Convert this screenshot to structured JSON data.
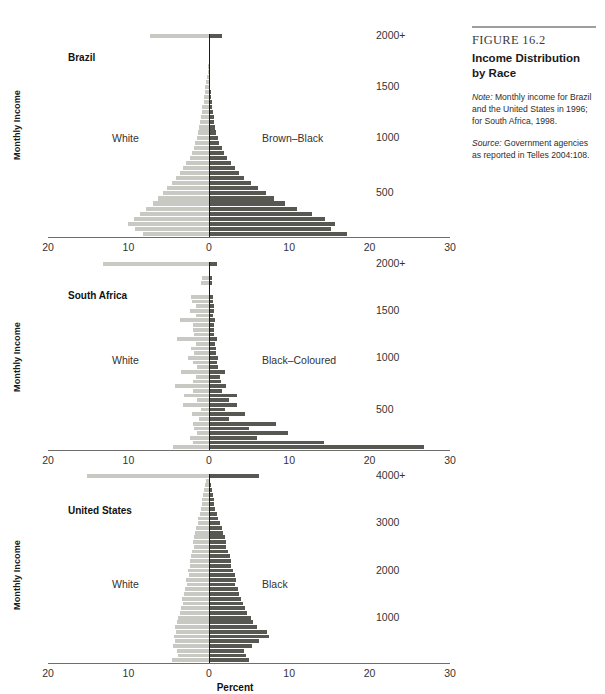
{
  "caption": {
    "figure_number": "FIGURE 16.2",
    "title": "Income Distribution by Race",
    "note_label": "Note:",
    "note_text": " Monthly income for Brazil and the United States in 1996; for South Africa, 1998.",
    "source_label": "Source:",
    "source_text": " Government agencies as reported in Telles 2004:108."
  },
  "axis": {
    "y_axis_title": "Monthly Income",
    "x_axis_title": "Percent",
    "x_tick_labels": [
      "20",
      "10",
      "0",
      "10",
      "20",
      "30"
    ],
    "x_tick_values": [
      -20,
      -10,
      0,
      10,
      20,
      30
    ]
  },
  "colors": {
    "left_bar": "#c9c9c4",
    "right_bar": "#585853",
    "axis": "#6e6e6e",
    "zero_line": "#1a1a1a",
    "text": "#333333"
  },
  "chart_data": [
    {
      "type": "bar",
      "orientation": "horizontal",
      "subtype": "population-pyramid",
      "panel_index": 0,
      "title": "Brazil",
      "xlabel": "Percent",
      "ylabel": "Monthly Income",
      "xlim": [
        -20,
        30
      ],
      "grid": false,
      "left_series_name": "White",
      "right_series_name": "Brown–Black",
      "y_tick_labels": [
        "2000+",
        "1500",
        "1000",
        "500"
      ],
      "y_tick_positions": [
        0,
        10,
        20,
        31
      ],
      "categories": [
        "2000+",
        "1950",
        "1900",
        "1850",
        "1800",
        "1750",
        "1700",
        "1650",
        "1600",
        "1550",
        "1500",
        "1450",
        "1400",
        "1350",
        "1300",
        "1250",
        "1200",
        "1150",
        "1100",
        "1050",
        "1000",
        "950",
        "900",
        "850",
        "800",
        "750",
        "700",
        "650",
        "600",
        "550",
        "500",
        "450",
        "400",
        "350",
        "300",
        "250",
        "200",
        "150",
        "100",
        "50"
      ],
      "series": [
        {
          "name": "White",
          "values": [
            7.3,
            0,
            0,
            0,
            0,
            0,
            0.1,
            0.15,
            0.2,
            0.3,
            0.45,
            0.5,
            0.6,
            0.65,
            0.8,
            0.85,
            1.0,
            1.1,
            1.2,
            1.3,
            1.5,
            1.7,
            1.9,
            2.1,
            2.4,
            2.8,
            3.2,
            3.6,
            4.1,
            4.6,
            5.2,
            5.7,
            6.3,
            7.0,
            7.8,
            8.5,
            9.3,
            10.1,
            9.2,
            8.2
          ]
        },
        {
          "name": "Brown–Black",
          "values": [
            1.6,
            0,
            0,
            0,
            0,
            0,
            0.05,
            0.08,
            0.1,
            0.15,
            0.2,
            0.25,
            0.3,
            0.35,
            0.45,
            0.5,
            0.6,
            0.7,
            0.8,
            0.95,
            1.1,
            1.3,
            1.6,
            1.9,
            2.3,
            2.7,
            3.2,
            3.8,
            4.4,
            5.2,
            6.1,
            7.1,
            8.1,
            9.5,
            11.0,
            12.8,
            14.5,
            15.7,
            15.2,
            17.2
          ]
        }
      ]
    },
    {
      "type": "bar",
      "orientation": "horizontal",
      "subtype": "population-pyramid",
      "panel_index": 1,
      "title": "South Africa",
      "xlabel": "Percent",
      "ylabel": "Monthly Income",
      "xlim": [
        -20,
        30
      ],
      "grid": false,
      "left_series_name": "White",
      "right_series_name": "Black–Coloured",
      "y_tick_labels": [
        "2000+",
        "1500",
        "1000",
        "500"
      ],
      "y_tick_positions": [
        0,
        10,
        20,
        31
      ],
      "categories": [
        "2000+",
        "1950",
        "1900",
        "1850",
        "1800",
        "1750",
        "1700",
        "1650",
        "1600",
        "1550",
        "1500",
        "1450",
        "1400",
        "1350",
        "1300",
        "1250",
        "1200",
        "1150",
        "1100",
        "1050",
        "1000",
        "950",
        "900",
        "850",
        "800",
        "750",
        "700",
        "650",
        "600",
        "550",
        "500",
        "450",
        "400",
        "350",
        "300",
        "250",
        "200",
        "150",
        "100",
        "50"
      ],
      "series": [
        {
          "name": "White",
          "values": [
            13.2,
            0,
            0,
            0.9,
            1.0,
            0,
            0,
            2.2,
            2.1,
            1.6,
            2.4,
            1.6,
            3.6,
            2.0,
            2.0,
            1.8,
            4.0,
            1.6,
            2.2,
            1.8,
            2.6,
            2.0,
            1.5,
            3.5,
            1.6,
            2.0,
            4.2,
            2.0,
            3.1,
            1.5,
            3.2,
            1.0,
            2.1,
            1.2,
            2.0,
            1.8,
            1.5,
            2.4,
            2.0,
            4.5
          ]
        },
        {
          "name": "Black–Coloured",
          "values": [
            1.0,
            0,
            0,
            0.4,
            0.4,
            0,
            0,
            0.5,
            0.5,
            0.6,
            0.7,
            0.5,
            0.8,
            0.6,
            0.7,
            0.7,
            1.0,
            0.8,
            0.9,
            0.9,
            1.1,
            1.0,
            1.1,
            2.0,
            1.4,
            1.5,
            2.2,
            1.6,
            3.5,
            2.5,
            3.5,
            2.0,
            4.5,
            2.5,
            8.4,
            5.0,
            9.8,
            6.0,
            14.3,
            26.8
          ]
        }
      ]
    },
    {
      "type": "bar",
      "orientation": "horizontal",
      "subtype": "population-pyramid",
      "panel_index": 2,
      "title": "United States",
      "xlabel": "Percent",
      "ylabel": "Monthly Income",
      "xlim": [
        -20,
        30
      ],
      "grid": false,
      "left_series_name": "White",
      "right_series_name": "Black",
      "y_tick_labels": [
        "4000+",
        "3000",
        "2000",
        "1000"
      ],
      "y_tick_positions": [
        0,
        10,
        20,
        30
      ],
      "categories": [
        "4000+",
        "3900",
        "3800",
        "3700",
        "3600",
        "3500",
        "3400",
        "3300",
        "3200",
        "3100",
        "3000",
        "2900",
        "2800",
        "2700",
        "2600",
        "2500",
        "2400",
        "2300",
        "2200",
        "2100",
        "2000",
        "1900",
        "1800",
        "1700",
        "1600",
        "1500",
        "1400",
        "1300",
        "1200",
        "1100",
        "1000",
        "900",
        "800",
        "700",
        "600",
        "500",
        "400",
        "300",
        "200",
        "100"
      ],
      "series": [
        {
          "name": "White",
          "values": [
            15.2,
            0.3,
            0.5,
            0.6,
            0.7,
            0.8,
            0.9,
            1.0,
            1.1,
            1.3,
            1.4,
            1.6,
            1.7,
            1.8,
            2.0,
            1.9,
            2.1,
            2.2,
            2.4,
            2.3,
            2.6,
            2.5,
            2.8,
            2.7,
            3.0,
            3.1,
            3.3,
            3.2,
            3.5,
            3.6,
            3.8,
            4.0,
            4.2,
            4.1,
            4.3,
            4.2,
            4.4,
            4.0,
            3.8,
            4.6
          ]
        },
        {
          "name": "Black",
          "values": [
            6.3,
            0.2,
            0.3,
            0.4,
            0.5,
            0.6,
            0.7,
            0.8,
            1.0,
            1.2,
            1.4,
            1.6,
            1.8,
            2.0,
            2.2,
            2.1,
            2.4,
            2.6,
            2.8,
            2.7,
            3.0,
            3.2,
            3.4,
            3.3,
            3.6,
            3.8,
            4.0,
            4.2,
            4.5,
            4.8,
            5.2,
            5.5,
            6.0,
            7.2,
            7.5,
            6.2,
            5.4,
            4.4,
            4.6,
            5.0
          ]
        }
      ]
    }
  ]
}
